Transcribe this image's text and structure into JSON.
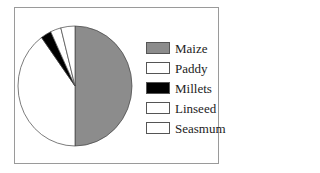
{
  "chart_data": {
    "type": "pie",
    "title": "",
    "categories": [
      "Maize",
      "Paddy",
      "Millets",
      "Linseed",
      "Seasmum"
    ],
    "values": [
      50,
      40,
      3,
      3,
      4
    ],
    "colors": [
      "#8c8c8c",
      "#ffffff",
      "#000000",
      "#ffffff",
      "#ffffff"
    ],
    "legend_position": "right",
    "start_angle": "12 o'clock, clockwise"
  },
  "legend": {
    "items": [
      {
        "label": "Maize",
        "color": "#8c8c8c"
      },
      {
        "label": "Paddy",
        "color": "#ffffff"
      },
      {
        "label": "Millets",
        "color": "#000000"
      },
      {
        "label": "Linseed",
        "color": "#ffffff"
      },
      {
        "label": "Seasmum",
        "color": "#ffffff"
      }
    ]
  }
}
